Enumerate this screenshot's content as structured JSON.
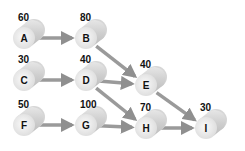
{
  "diagram": {
    "type": "network",
    "colors": {
      "cylinder": "#d0d0d0",
      "face": "#eeeeee",
      "arrow": "#9a9a9a",
      "text": "#111111"
    },
    "nodes": [
      {
        "id": "A",
        "value": "60",
        "x": 24,
        "y": 38
      },
      {
        "id": "B",
        "value": "80",
        "x": 86,
        "y": 38
      },
      {
        "id": "C",
        "value": "30",
        "x": 24,
        "y": 80
      },
      {
        "id": "D",
        "value": "40",
        "x": 86,
        "y": 80
      },
      {
        "id": "E",
        "value": "40",
        "x": 146,
        "y": 85
      },
      {
        "id": "F",
        "value": "50",
        "x": 24,
        "y": 125
      },
      {
        "id": "G",
        "value": "100",
        "x": 86,
        "y": 125
      },
      {
        "id": "H",
        "value": "70",
        "x": 146,
        "y": 128
      },
      {
        "id": "I",
        "value": "30",
        "x": 206,
        "y": 128
      }
    ],
    "edges": [
      {
        "from": "A",
        "to": "B"
      },
      {
        "from": "B",
        "to": "E"
      },
      {
        "from": "C",
        "to": "D"
      },
      {
        "from": "D",
        "to": "E"
      },
      {
        "from": "D",
        "to": "H"
      },
      {
        "from": "E",
        "to": "I"
      },
      {
        "from": "F",
        "to": "G"
      },
      {
        "from": "G",
        "to": "H"
      },
      {
        "from": "H",
        "to": "I"
      }
    ]
  }
}
